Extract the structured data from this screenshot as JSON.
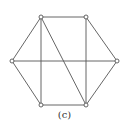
{
  "figure": {
    "caption": "(c)",
    "colors": {
      "edge": "#555555",
      "vertex_stroke": "#555555",
      "vertex_fill": "#ffffff"
    },
    "vertices": [
      {
        "id": "TL",
        "x": 41,
        "y": 17
      },
      {
        "id": "TR",
        "x": 86,
        "y": 17
      },
      {
        "id": "R",
        "x": 117,
        "y": 61
      },
      {
        "id": "BR",
        "x": 86,
        "y": 105
      },
      {
        "id": "BL",
        "x": 41,
        "y": 105
      },
      {
        "id": "L",
        "x": 12,
        "y": 61
      }
    ],
    "edges": [
      [
        "TL",
        "TR"
      ],
      [
        "TR",
        "R"
      ],
      [
        "R",
        "BR"
      ],
      [
        "BR",
        "BL"
      ],
      [
        "BL",
        "L"
      ],
      [
        "L",
        "TL"
      ],
      [
        "TL",
        "BL"
      ],
      [
        "TR",
        "BR"
      ],
      [
        "TL",
        "BR"
      ],
      [
        "L",
        "R"
      ]
    ]
  }
}
